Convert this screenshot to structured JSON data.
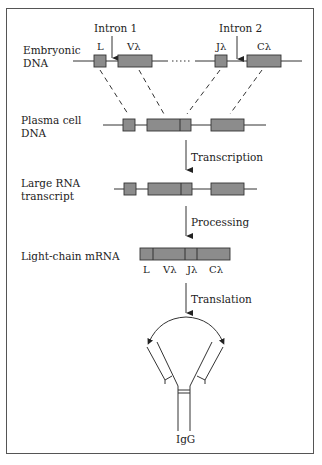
{
  "figure": {
    "rows": [
      {
        "id": "embryonic",
        "label_line1": "Embryonic",
        "label_line2": "DNA"
      },
      {
        "id": "plasma",
        "label_line1": "Plasma cell",
        "label_line2": "DNA"
      },
      {
        "id": "rna",
        "label_line1": "Large RNA",
        "label_line2": "transcript"
      },
      {
        "id": "mrna",
        "label_line1": "Light-chain mRNA",
        "label_line2": ""
      }
    ],
    "introns": {
      "intron1": "Intron 1",
      "intron2": "Intron 2"
    },
    "segments": {
      "L": "L",
      "V": "Vλ",
      "J": "Jλ",
      "C": "Cλ"
    },
    "steps": {
      "transcription": "Transcription",
      "processing": "Processing",
      "translation": "Translation"
    },
    "product": "IgG",
    "colors": {
      "segment_fill": "#8c8c8c",
      "line": "#333333",
      "border": "#555555"
    }
  }
}
